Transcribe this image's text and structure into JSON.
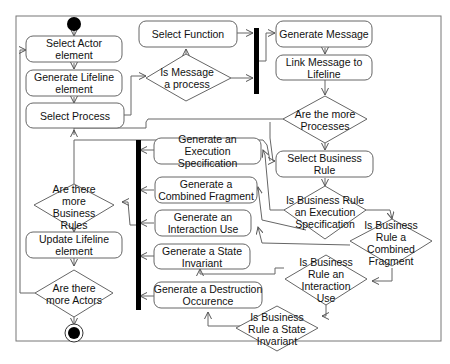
{
  "diagram": {
    "type": "UML activity diagram",
    "colors": {
      "stroke": "#555555",
      "bar": "#000000",
      "fill": "#ffffff",
      "text": "#111111"
    },
    "start_node": "initial-node",
    "end_node": "final-node",
    "actions": {
      "select_actor": "Select Actor element",
      "generate_lifeline": "Generate Lifeline element",
      "select_process": "Select Process",
      "select_function": "Select Function",
      "generate_message": "Generate Message",
      "link_message": "Link Message to Lifeline",
      "select_business_rule": "Select Business Rule",
      "gen_execution_spec": "Generate an Execution Specification",
      "gen_combined_fragment": "Generate a Combined Fragment",
      "gen_interaction_use": "Generate an Interaction Use",
      "gen_state_invariant": "Generate a State Invariant",
      "gen_destruction": "Generate a Destruction Occurence",
      "update_lifeline": "Update Lifeline element"
    },
    "decisions": {
      "is_message_process": "Is Message a process",
      "more_processes": "Are the more Processes",
      "is_exec_spec": "Is Business Rule an Execution Specification",
      "is_combined_fragment": "Is Business Rule a Combined Fragment",
      "is_interaction_use": "Is Business Rule an Interaction Use",
      "is_state_invariant": "Is Business Rule a State Invariant",
      "more_business_rules": "Are there more Business Rules",
      "more_actors": "Are there more Actors"
    }
  }
}
